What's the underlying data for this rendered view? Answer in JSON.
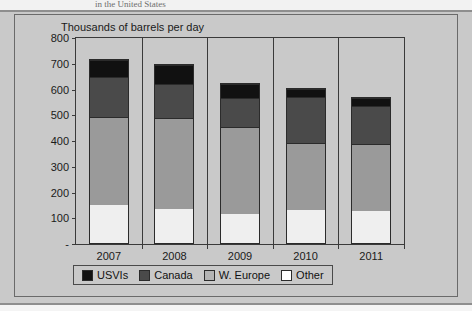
{
  "page": {
    "clipped_header_text": "in the United States",
    "background_color": "#c9c9c9"
  },
  "chart_data": {
    "type": "bar",
    "stacked": true,
    "title": "",
    "ylabel": "Thousands of barrels per day",
    "xlabel": "",
    "categories": [
      "2007",
      "2008",
      "2009",
      "2010",
      "2011"
    ],
    "ylim": [
      0,
      800
    ],
    "ytick_labels": [
      "-",
      "100",
      "200",
      "300",
      "400",
      "500",
      "600",
      "700",
      "800"
    ],
    "ytick_values": [
      0,
      100,
      200,
      300,
      400,
      500,
      600,
      700,
      800
    ],
    "grid": false,
    "legend_position": "bottom",
    "series": [
      {
        "name": "Other",
        "color": "#ffffff",
        "values": [
          150,
          135,
          115,
          130,
          125
        ]
      },
      {
        "name": "W. Europe",
        "color": "#9a9a9a",
        "values": [
          345,
          355,
          340,
          263,
          263
        ]
      },
      {
        "name": "Canada",
        "color": "#4a4a4a",
        "values": [
          155,
          135,
          115,
          180,
          152
        ]
      },
      {
        "name": "USVIs",
        "color": "#111111",
        "values": [
          70,
          75,
          55,
          34,
          30
        ]
      }
    ],
    "stack_order_bottom_to_top": [
      "Other",
      "W. Europe",
      "Canada",
      "USVIs"
    ],
    "totals": [
      720,
      700,
      625,
      607,
      570
    ],
    "legend_entries": [
      {
        "label": "USVIs",
        "color": "#111111"
      },
      {
        "label": "Canada",
        "color": "#4a4a4a"
      },
      {
        "label": "W. Europe",
        "color": "#b4b4b4"
      },
      {
        "label": "Other",
        "color": "#ffffff"
      }
    ]
  }
}
